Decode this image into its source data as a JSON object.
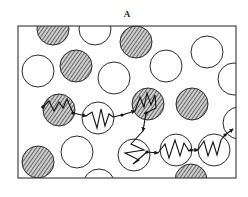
{
  "figure": {
    "panel_label": "A"
  },
  "legend_semantics": {
    "hatched_particle": "hatched (filled) particle",
    "open_particle": "open (empty) particle",
    "spring_segment": "zigzag chain segment",
    "link": "arrowed connector between segments"
  },
  "colors": {
    "stroke": "#2a2a2a",
    "hatch": "#3a3a3a",
    "hatch_bg": "#cfcfcf",
    "background": "#ffffff"
  }
}
